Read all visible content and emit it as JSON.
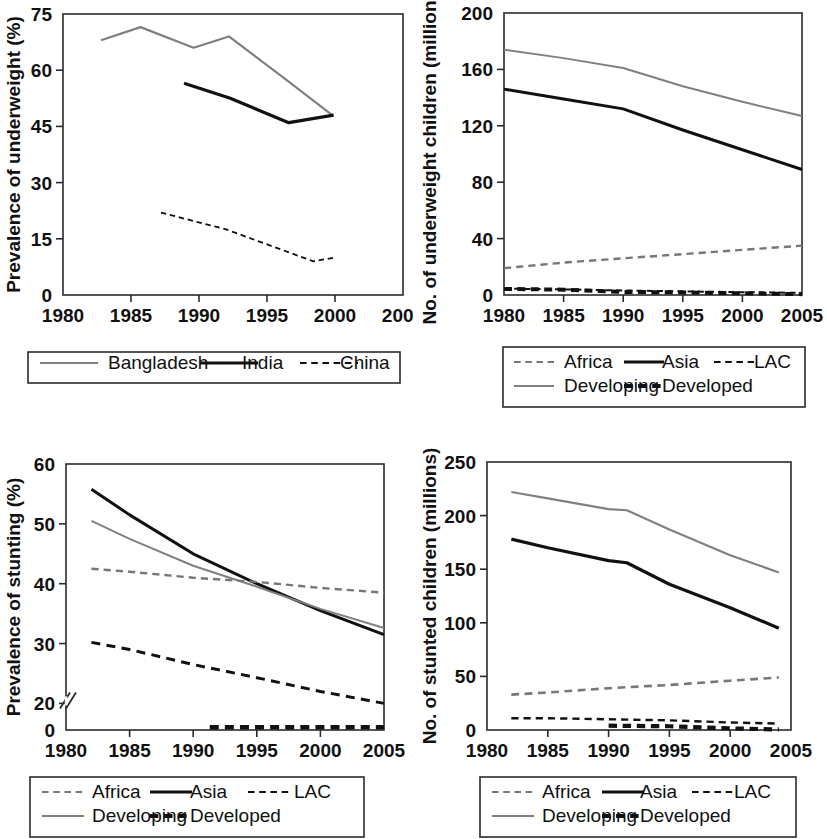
{
  "figure": {
    "panels": [
      "underweight_prevalence",
      "underweight_number",
      "stunting_prevalence",
      "stunting_number"
    ]
  },
  "chart_data": [
    {
      "id": "underweight_prevalence",
      "type": "line",
      "title": "",
      "xlabel": "",
      "ylabel": "Prevalence of underweight (%)",
      "xlim": [
        1980,
        2005
      ],
      "ylim": [
        0,
        75
      ],
      "xticks": [
        1980,
        1985,
        1990,
        1995,
        2000,
        2005
      ],
      "yticks": [
        0,
        15,
        30,
        45,
        60,
        75
      ],
      "xtick_labels": [
        "1980",
        "1985",
        "1990",
        "1995",
        "2000",
        "2005"
      ],
      "ytick_labels": [
        "0",
        "15",
        "30",
        "45",
        "60",
        "75"
      ],
      "grid": false,
      "axis_break": false,
      "legend_position": "below",
      "legend_columns": 3,
      "series": [
        {
          "name": "Bangladesh",
          "style": "solid",
          "color": "#808080",
          "width": 2.2,
          "x": [
            1982.8,
            1985.7,
            1989.6,
            1992.2,
            1996.4,
            1999.8
          ],
          "y": [
            68.0,
            71.5,
            66.0,
            69.0,
            57.5,
            48.0
          ]
        },
        {
          "name": "India",
          "style": "solid",
          "color": "#111111",
          "width": 3.2,
          "x": [
            1988.9,
            1992.3,
            1996.6,
            1999.9
          ],
          "y": [
            56.5,
            52.5,
            46.0,
            48.0
          ]
        },
        {
          "name": "China",
          "style": "dashed",
          "color": "#111111",
          "width": 1.8,
          "x": [
            1987.2,
            1992.0,
            1998.4,
            2000.0
          ],
          "y": [
            22.0,
            17.5,
            9.0,
            10.0
          ]
        }
      ]
    },
    {
      "id": "underweight_number",
      "type": "line",
      "title": "",
      "xlabel": "",
      "ylabel": "No. of underweight children (millions)",
      "xlim": [
        1980,
        2005
      ],
      "ylim": [
        0,
        200
      ],
      "xticks": [
        1980,
        1985,
        1990,
        1995,
        2000,
        2005
      ],
      "yticks": [
        0,
        40,
        80,
        120,
        160,
        200
      ],
      "xtick_labels": [
        "1980",
        "1985",
        "1990",
        "1995",
        "2000",
        "2005"
      ],
      "ytick_labels": [
        "0",
        "40",
        "80",
        "120",
        "160",
        "200"
      ],
      "grid": false,
      "axis_break": false,
      "legend_position": "below",
      "legend_columns": 3,
      "series": [
        {
          "name": "Developing",
          "style": "solid",
          "color": "#808080",
          "width": 2.0,
          "x": [
            1980,
            1985,
            1990,
            1995,
            2000,
            2005
          ],
          "y": [
            174,
            168,
            161,
            148,
            137,
            127
          ]
        },
        {
          "name": "Asia",
          "style": "solid",
          "color": "#111111",
          "width": 3.0,
          "x": [
            1980,
            1985,
            1990,
            1995,
            2000,
            2005
          ],
          "y": [
            146,
            139,
            132,
            117,
            103,
            89
          ]
        },
        {
          "name": "Africa",
          "style": "dashed",
          "color": "#777777",
          "width": 2.4,
          "x": [
            1980,
            1985,
            1990,
            1995,
            2000,
            2005
          ],
          "y": [
            19,
            23,
            26,
            29,
            32,
            35
          ]
        },
        {
          "name": "LAC",
          "style": "dashed",
          "color": "#111111",
          "width": 2.0,
          "x": [
            1980,
            1985,
            1990,
            1995,
            2000,
            2005
          ],
          "y": [
            4.5,
            4.0,
            3.2,
            2.6,
            2.0,
            1.5
          ]
        },
        {
          "name": "Developed",
          "style": "dashed-thick",
          "color": "#111111",
          "width": 4.0,
          "x": [
            1980,
            1985,
            1990,
            1995,
            2000,
            2005
          ],
          "y": [
            4.3,
            3.8,
            2.2,
            1.8,
            1.2,
            0.6
          ]
        }
      ]
    },
    {
      "id": "stunting_prevalence",
      "type": "line",
      "title": "",
      "xlabel": "",
      "ylabel": "Prevalence of stunting (%)",
      "xlim": [
        1980,
        2005
      ],
      "ylim": [
        0,
        60
      ],
      "xticks": [
        1980,
        1985,
        1990,
        1995,
        2000,
        2005
      ],
      "yticks": [
        0,
        20,
        30,
        40,
        50,
        60
      ],
      "xtick_labels": [
        "0",
        "20",
        "30",
        "40",
        "50",
        "60"
      ],
      "ytick_labels": [
        "0",
        "20",
        "30",
        "40",
        "50",
        "60"
      ],
      "grid": false,
      "axis_break": true,
      "axis_break_note": "y-axis broken between 0 and 20",
      "legend_position": "below",
      "legend_columns": 3,
      "series": [
        {
          "name": "Asia",
          "style": "solid",
          "color": "#111111",
          "width": 3.0,
          "x": [
            1982,
            1985,
            1990,
            1995,
            2000,
            2005
          ],
          "y": [
            55.8,
            51.5,
            45.0,
            40.0,
            35.5,
            31.5
          ]
        },
        {
          "name": "Developing",
          "style": "solid",
          "color": "#808080",
          "width": 2.0,
          "x": [
            1982,
            1985,
            1990,
            1995,
            2000,
            2005
          ],
          "y": [
            50.5,
            47.5,
            43.0,
            39.5,
            35.8,
            32.6
          ]
        },
        {
          "name": "Africa",
          "style": "dashed",
          "color": "#777777",
          "width": 2.4,
          "x": [
            1982,
            1985,
            1990,
            1995,
            2000,
            2005
          ],
          "y": [
            42.5,
            42.0,
            41.0,
            40.3,
            39.3,
            38.5
          ]
        },
        {
          "name": "LAC",
          "style": "dashed",
          "color": "#111111",
          "width": 3.0,
          "x": [
            1982,
            1985,
            1990,
            1995,
            2000,
            2005
          ],
          "y": [
            30.2,
            29.0,
            26.5,
            24.3,
            22.0,
            20.0
          ]
        },
        {
          "name": "Developed",
          "style": "dashed-thick",
          "color": "#111111",
          "width": 4.5,
          "x": [
            1991.3,
            1995,
            2000,
            2005
          ],
          "y": [
            2.0,
            2.0,
            2.0,
            2.0
          ]
        }
      ]
    },
    {
      "id": "stunting_number",
      "type": "line",
      "title": "",
      "xlabel": "",
      "ylabel": "No. of stunted children (millions)",
      "xlim": [
        1980,
        2005
      ],
      "ylim": [
        0,
        250
      ],
      "xticks": [
        1980,
        1985,
        1990,
        1995,
        2000,
        2005
      ],
      "yticks": [
        0,
        50,
        100,
        150,
        200,
        250
      ],
      "xtick_labels": [
        "1980",
        "1985",
        "1990",
        "1995",
        "2000",
        "2005"
      ],
      "ytick_labels": [
        "0",
        "50",
        "100",
        "150",
        "200",
        "250"
      ],
      "grid": false,
      "axis_break": false,
      "legend_position": "below",
      "legend_columns": 3,
      "series": [
        {
          "name": "Developing",
          "style": "solid",
          "color": "#808080",
          "width": 2.2,
          "x": [
            1982,
            1985,
            1990,
            1991.5,
            1995,
            2000,
            2004
          ],
          "y": [
            222,
            216,
            206,
            205,
            187,
            163,
            147
          ]
        },
        {
          "name": "Asia",
          "style": "solid",
          "color": "#111111",
          "width": 3.2,
          "x": [
            1982,
            1985,
            1990,
            1991.5,
            1995,
            2000,
            2004
          ],
          "y": [
            178,
            170,
            158,
            156,
            136,
            114,
            95
          ]
        },
        {
          "name": "Africa",
          "style": "dashed",
          "color": "#777777",
          "width": 2.6,
          "x": [
            1982,
            1985,
            1990,
            1995,
            2000,
            2004
          ],
          "y": [
            33,
            35,
            39,
            42,
            46,
            49
          ]
        },
        {
          "name": "LAC",
          "style": "dashed",
          "color": "#111111",
          "width": 2.4,
          "x": [
            1982,
            1985,
            1990,
            1995,
            2000,
            2004
          ],
          "y": [
            11,
            11,
            10,
            9,
            7,
            6
          ]
        },
        {
          "name": "Developed",
          "style": "dashed-thick",
          "color": "#111111",
          "width": 4.2,
          "x": [
            1990,
            1995,
            2000,
            2004
          ],
          "y": [
            4.0,
            3.5,
            1.5,
            0.5
          ]
        }
      ]
    }
  ],
  "panels": {
    "underweight_prevalence": {
      "ylabel": "Prevalence of underweight (%)",
      "ytick_labels": [
        "75",
        "60",
        "45",
        "30",
        "15",
        "0"
      ],
      "xtick_labels": [
        "1980",
        "1985",
        "1990",
        "1995",
        "2000",
        "2005"
      ],
      "legend": [
        {
          "label": "Bangladesh",
          "style": "solid",
          "color": "#808080"
        },
        {
          "label": "India",
          "style": "solid",
          "color": "#111111"
        },
        {
          "label": "China",
          "style": "dashed",
          "color": "#111111"
        }
      ]
    },
    "underweight_number": {
      "ylabel": "No. of underweight children (millions)",
      "ytick_labels": [
        "200",
        "160",
        "120",
        "80",
        "40",
        "0"
      ],
      "xtick_labels": [
        "1980",
        "1985",
        "1990",
        "1995",
        "2000",
        "2005"
      ],
      "legend": [
        {
          "label": "Africa",
          "style": "dashed",
          "color": "#777777"
        },
        {
          "label": "Asia",
          "style": "solid",
          "color": "#111111"
        },
        {
          "label": "LAC",
          "style": "dashed",
          "color": "#111111"
        },
        {
          "label": "Developing",
          "style": "solid",
          "color": "#808080"
        },
        {
          "label": "Developed",
          "style": "dashed-thick",
          "color": "#111111"
        }
      ]
    },
    "stunting_prevalence": {
      "ylabel": "Prevalence of stunting (%)",
      "ytick_labels": [
        "60",
        "50",
        "40",
        "30",
        "20",
        "0"
      ],
      "xtick_labels": [
        "1980",
        "1985",
        "1990",
        "1995",
        "2000",
        "2005"
      ],
      "legend": [
        {
          "label": "Africa",
          "style": "dashed",
          "color": "#777777"
        },
        {
          "label": "Asia",
          "style": "solid",
          "color": "#111111"
        },
        {
          "label": "LAC",
          "style": "dashed",
          "color": "#111111"
        },
        {
          "label": "Developing",
          "style": "solid",
          "color": "#808080"
        },
        {
          "label": "Developed",
          "style": "dashed-thick",
          "color": "#111111"
        }
      ]
    },
    "stunting_number": {
      "ylabel": "No. of stunted children (millions)",
      "ytick_labels": [
        "250",
        "200",
        "150",
        "100",
        "50",
        "0"
      ],
      "xtick_labels": [
        "1980",
        "1985",
        "1990",
        "1995",
        "2000",
        "2005"
      ],
      "legend": [
        {
          "label": "Africa",
          "style": "dashed",
          "color": "#777777"
        },
        {
          "label": "Asia",
          "style": "solid",
          "color": "#111111"
        },
        {
          "label": "LAC",
          "style": "dashed",
          "color": "#111111"
        },
        {
          "label": "Developing",
          "style": "solid",
          "color": "#808080"
        },
        {
          "label": "Developed",
          "style": "dashed-thick",
          "color": "#111111"
        }
      ]
    }
  }
}
